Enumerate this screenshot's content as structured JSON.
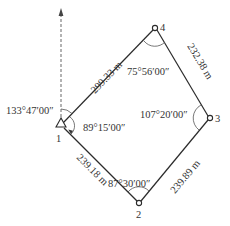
{
  "diagram": {
    "type": "closed traverse",
    "colors": {
      "line": "#2b2b2b",
      "text": "#333333",
      "arc": "#555555"
    },
    "north_arrow": {
      "label": "north-direction"
    },
    "stations": [
      {
        "id": "1",
        "label": "1",
        "marker": "triangle"
      },
      {
        "id": "2",
        "label": "2",
        "marker": "circle"
      },
      {
        "id": "3",
        "label": "3",
        "marker": "circle"
      },
      {
        "id": "4",
        "label": "4",
        "marker": "circle"
      }
    ],
    "edges": [
      {
        "from": "1",
        "to": "4",
        "length": "299.33 m"
      },
      {
        "from": "4",
        "to": "3",
        "length": "232.38 m"
      },
      {
        "from": "3",
        "to": "2",
        "length": "239.89 m"
      },
      {
        "from": "2",
        "to": "1",
        "length": "239.18 m"
      }
    ],
    "angles": {
      "bearing_1_4": "133°47′00″",
      "station_1": "89°15′00″",
      "station_2": "87°30′00″",
      "station_3": "107°20′00″",
      "station_4": "75°56′00″"
    }
  }
}
